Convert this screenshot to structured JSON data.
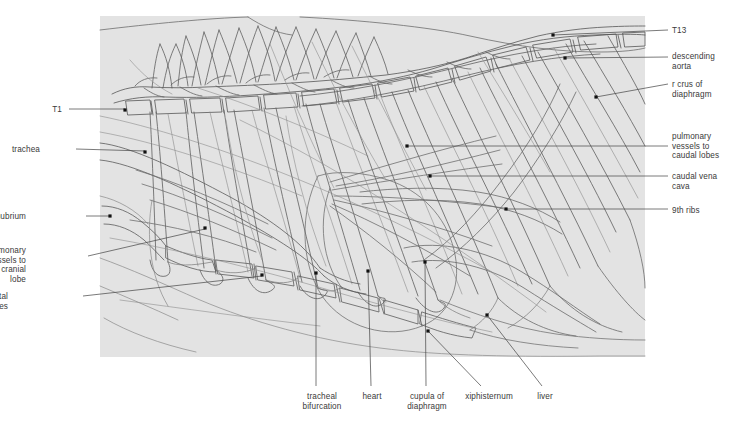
{
  "figure": {
    "panel": {
      "fill": "#e3e3e3",
      "x": 100,
      "y": 16,
      "width": 545,
      "height": 341
    },
    "ink": "#4a4a4a",
    "label_color": "#3a3a3a",
    "dot_color": "#111111"
  },
  "labels": {
    "left": [
      {
        "id": "t1",
        "text": "T1",
        "tx": 62,
        "ty": 105,
        "align": "r",
        "dot_x": 125,
        "dot_y": 110,
        "line": "M 69 109 L 125 109"
      },
      {
        "id": "trachea",
        "text": "trachea",
        "tx": 40,
        "ty": 145,
        "align": "r",
        "dot_x": 145,
        "dot_y": 152,
        "line": "M 76 149 L 145 151"
      },
      {
        "id": "manubrium",
        "text": "manubrium",
        "tx": 26,
        "ty": 212,
        "align": "r",
        "dot_x": 110,
        "dot_y": 216,
        "line": "M 86 216 L 110 216"
      },
      {
        "id": "pulmonary-cranial",
        "text": "pulmonary\nvessels to\ncranial lobe",
        "tx": 26,
        "ty": 246,
        "align": "r",
        "dot_x": 205,
        "dot_y": 228,
        "line": "M 88 256 L 205 229"
      },
      {
        "id": "costal-cartilages",
        "text": "costal cartilages",
        "tx": 8,
        "ty": 292,
        "align": "r",
        "dot_x": 262,
        "dot_y": 275,
        "line": "M 83 296 L 262 276"
      }
    ],
    "right": [
      {
        "id": "t13",
        "text": "T13",
        "tx": 672,
        "ty": 26,
        "align": "l",
        "dot_x": 553,
        "dot_y": 35,
        "line": "M 553 35 L 668 30"
      },
      {
        "id": "descending-aorta",
        "text": "descending\naorta",
        "tx": 672,
        "ty": 52,
        "align": "l",
        "dot_x": 565,
        "dot_y": 58,
        "line": "M 565 58 L 668 57"
      },
      {
        "id": "r-crus-diaphragm",
        "text": "r crus of\ndiaphragm",
        "tx": 672,
        "ty": 80,
        "align": "l",
        "dot_x": 596,
        "dot_y": 97,
        "line": "M 596 97 L 668 84"
      },
      {
        "id": "pulmonary-caudal",
        "text": "pulmonary\nvessels to\ncaudal lobes",
        "tx": 672,
        "ty": 132,
        "align": "l",
        "dot_x": 407,
        "dot_y": 146,
        "line": "M 407 146 L 668 146"
      },
      {
        "id": "caudal-vena-cava",
        "text": "caudal vena\ncava",
        "tx": 672,
        "ty": 172,
        "align": "l",
        "dot_x": 430,
        "dot_y": 176,
        "line": "M 430 176 L 668 176"
      },
      {
        "id": "9th-ribs",
        "text": "9th ribs",
        "tx": 672,
        "ty": 206,
        "align": "l",
        "dot_x": 506,
        "dot_y": 209,
        "line": "M 506 209 L 668 209"
      }
    ],
    "bottom": [
      {
        "id": "tracheal-bifurcation",
        "text": "tracheal\nbifurcation",
        "tx": 322,
        "ty": 392,
        "align": "c",
        "dot_x": 316,
        "dot_y": 273,
        "line": "M 316 273 L 316 386"
      },
      {
        "id": "heart",
        "text": "heart",
        "tx": 372,
        "ty": 392,
        "align": "c",
        "dot_x": 368,
        "dot_y": 271,
        "line": "M 368 271 L 371 386"
      },
      {
        "id": "cupula-diaphragm",
        "text": "cupula of\ndiaphragm",
        "tx": 427,
        "ty": 392,
        "align": "c",
        "dot_x": 425,
        "dot_y": 262,
        "line": "M 425 262 L 426 386"
      },
      {
        "id": "xiphisternum",
        "text": "xiphisternum",
        "tx": 489,
        "ty": 392,
        "align": "c",
        "dot_x": 428,
        "dot_y": 331,
        "line": "M 428 331 L 481 386"
      },
      {
        "id": "liver",
        "text": "liver",
        "tx": 545,
        "ty": 392,
        "align": "c",
        "dot_x": 487,
        "dot_y": 315,
        "line": "M 487 315 L 542 386"
      }
    ]
  },
  "chart_data": {
    "type": "diagram",
    "structures": [
      "T1 vertebra",
      "T13 vertebra",
      "trachea",
      "tracheal bifurcation",
      "manubrium",
      "xiphisternum",
      "costal cartilages",
      "9th ribs",
      "heart",
      "liver",
      "cupula of diaphragm",
      "r crus of diaphragm",
      "descending aorta",
      "caudal vena cava",
      "pulmonary vessels to cranial lobe",
      "pulmonary vessels to caudal lobes"
    ]
  }
}
